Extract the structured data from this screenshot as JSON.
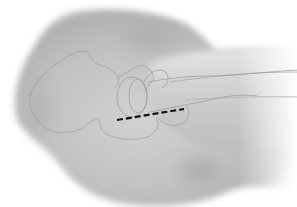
{
  "illustration": {
    "subject": "hip-joint-anatomy",
    "colors": {
      "background": "#ffffff",
      "skin_light": "#e6e6e6",
      "skin_mid": "#c4c4c4",
      "skin_dark": "#9a9a9a",
      "bone_outline": "#9e9e9e",
      "incision_line": "#111111"
    }
  }
}
